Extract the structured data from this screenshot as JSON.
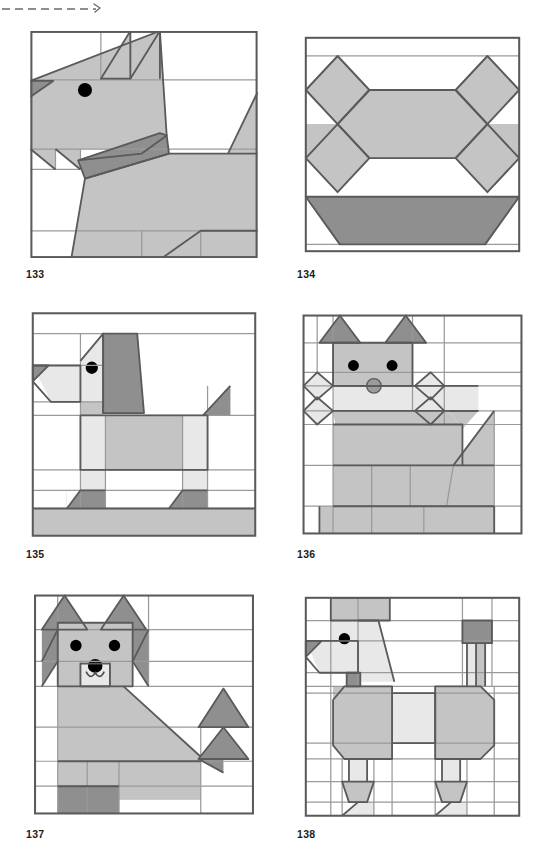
{
  "page": {
    "width": 540,
    "height": 855,
    "background": "#ffffff",
    "type": "quilt-block-pattern-page"
  },
  "palette": {
    "white": "#ffffff",
    "light": "#e8e8e8",
    "medium": "#c4c4c4",
    "dark": "#8f8f8f",
    "outline": "#5a5a5a",
    "grid_line": "#9a9a9a",
    "eye": "#000000",
    "nose": "#9c9c9c",
    "label_color": "#1c1c1c",
    "trim_mark_color": "#6a6a6a"
  },
  "trim_mark": {
    "name": "dashed-trim-line",
    "style": "dashed",
    "segments": 9,
    "arrow": true
  },
  "blocks": [
    {
      "id": "block-133",
      "label": "133",
      "subject": "dog head facing left with pointed ears",
      "x": 26,
      "y": 31,
      "size": 236,
      "label_x": 26,
      "label_y": 268
    },
    {
      "id": "block-134",
      "label": "134",
      "subject": "dog bone and bowl",
      "x": 297,
      "y": 31,
      "size": 231,
      "label_x": 297,
      "label_y": 268
    },
    {
      "id": "block-135",
      "label": "135",
      "subject": "standing dog in profile, facing left",
      "x": 26,
      "y": 311,
      "size": 236,
      "label_x": 26,
      "label_y": 548
    },
    {
      "id": "block-136",
      "label": "136",
      "subject": "front-facing puppy with bone in mouth",
      "x": 297,
      "y": 311,
      "size": 231,
      "label_x": 297,
      "label_y": 548
    },
    {
      "id": "block-137",
      "label": "137",
      "subject": "front-facing shaggy dog with bushy tail",
      "x": 26,
      "y": 591,
      "size": 236,
      "label_x": 26,
      "label_y": 828
    },
    {
      "id": "block-138",
      "label": "138",
      "subject": "poodle in profile, facing left",
      "x": 297,
      "y": 591,
      "size": 231,
      "label_x": 297,
      "label_y": 828
    }
  ]
}
